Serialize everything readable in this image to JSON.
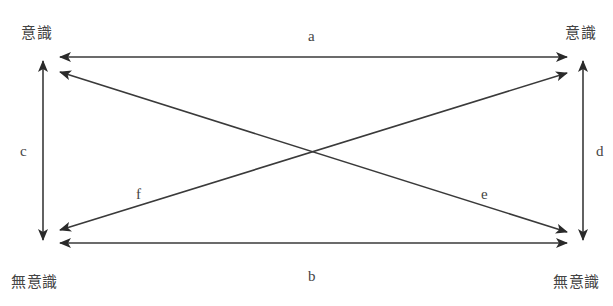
{
  "nodes": {
    "top_left": "意識",
    "top_right": "意識",
    "bottom_left": "無意識",
    "bottom_right": "無意識"
  },
  "edges": {
    "a": "a",
    "b": "b",
    "c": "c",
    "d": "d",
    "e": "e",
    "f": "f"
  },
  "colors": {
    "line": "#333333",
    "text": "#444444"
  }
}
